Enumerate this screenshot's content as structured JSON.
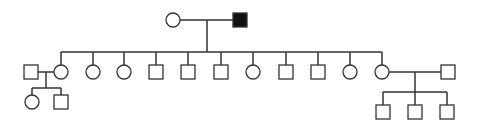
{
  "diagram": {
    "type": "pedigree",
    "colors": {
      "line": "#333333",
      "affected": "#111111",
      "unaffected": "#ffffff"
    },
    "individuals": [
      {
        "id": "I-1",
        "sex": "female",
        "affected": false,
        "x": 173,
        "y": 20
      },
      {
        "id": "I-2",
        "sex": "male",
        "affected": true,
        "x": 240,
        "y": 20
      },
      {
        "id": "II-spouse1",
        "sex": "male",
        "affected": false,
        "x": 31,
        "y": 72
      },
      {
        "id": "II-1",
        "sex": "female",
        "affected": false,
        "x": 61,
        "y": 72
      },
      {
        "id": "II-2",
        "sex": "female",
        "affected": false,
        "x": 93,
        "y": 72
      },
      {
        "id": "II-3",
        "sex": "female",
        "affected": false,
        "x": 124,
        "y": 72
      },
      {
        "id": "II-4",
        "sex": "male",
        "affected": false,
        "x": 156,
        "y": 72
      },
      {
        "id": "II-5",
        "sex": "male",
        "affected": false,
        "x": 188,
        "y": 72
      },
      {
        "id": "II-6",
        "sex": "male",
        "affected": false,
        "x": 221,
        "y": 72
      },
      {
        "id": "II-7",
        "sex": "female",
        "affected": false,
        "x": 253,
        "y": 72
      },
      {
        "id": "II-8",
        "sex": "male",
        "affected": false,
        "x": 286,
        "y": 72
      },
      {
        "id": "II-9",
        "sex": "male",
        "affected": false,
        "x": 318,
        "y": 72
      },
      {
        "id": "II-10",
        "sex": "female",
        "affected": false,
        "x": 350,
        "y": 72
      },
      {
        "id": "II-11",
        "sex": "female",
        "affected": false,
        "x": 382,
        "y": 72
      },
      {
        "id": "II-spouse2",
        "sex": "male",
        "affected": false,
        "x": 448,
        "y": 72
      },
      {
        "id": "III-1",
        "sex": "female",
        "affected": false,
        "x": 32,
        "y": 102
      },
      {
        "id": "III-2",
        "sex": "male",
        "affected": false,
        "x": 61,
        "y": 102
      },
      {
        "id": "III-3",
        "sex": "male",
        "affected": false,
        "x": 383,
        "y": 112
      },
      {
        "id": "III-4",
        "sex": "male",
        "affected": false,
        "x": 415,
        "y": 112
      },
      {
        "id": "III-5",
        "sex": "male",
        "affected": false,
        "x": 447,
        "y": 112
      }
    ]
  }
}
